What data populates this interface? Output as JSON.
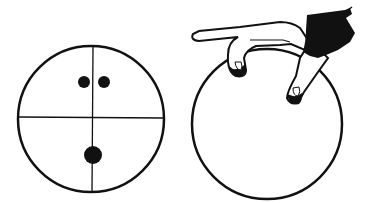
{
  "figure": {
    "colors": {
      "ink": "#111111",
      "background": "#ffffff"
    },
    "panels": [
      {
        "name": "ball-layout",
        "holes": [
          "middle-finger-hole",
          "ring-finger-hole",
          "thumb-hole"
        ],
        "guides": [
          "horizontal-axis",
          "vertical-axis"
        ]
      },
      {
        "name": "hand-gripping-ball",
        "elements": [
          "ball-outline",
          "hand",
          "sleeve"
        ]
      }
    ]
  }
}
